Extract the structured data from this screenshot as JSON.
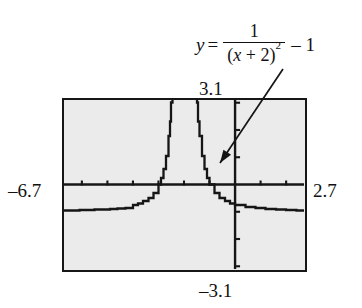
{
  "figure": {
    "kind": "graphing-calculator-screenshot",
    "equation": {
      "lhs": "y",
      "equals": "=",
      "numerator": "1",
      "denominator_open": "(",
      "denominator_var": "x",
      "denominator_plus": " + 2",
      "denominator_close": ")",
      "denominator_exponent": "2",
      "tail": "– 1",
      "plain": "y = 1/(x + 2)^2 – 1"
    },
    "window": {
      "ymax_label": "3.1",
      "ymin_label": "–3.1",
      "xmin_label": "–6.7",
      "xmax_label": "2.7"
    },
    "colors": {
      "screen_background": "#ebebeb",
      "frame": "#161616",
      "ink": "#111111",
      "curve": "#161616"
    }
  },
  "chart_data": {
    "type": "line",
    "title": "",
    "subtitle": "",
    "xlabel": "",
    "ylabel": "",
    "function": "y = 1/(x + 2)^2 - 1",
    "xlim": [
      -6.7,
      2.7
    ],
    "ylim": [
      -3.1,
      3.1
    ],
    "grid": false,
    "legend": null,
    "axes": {
      "x_axis_at_y": 0,
      "y_axis_at_x": 0,
      "x_tick_step": 1,
      "y_tick_step": 1,
      "x_ticks": [
        -6,
        -5,
        -4,
        -3,
        -2,
        -1,
        0,
        1,
        2
      ],
      "y_ticks": [
        -3,
        -2,
        -1,
        1,
        2,
        3
      ]
    },
    "asymptotes": {
      "vertical": [
        -2
      ],
      "horizontal": [
        -1
      ]
    },
    "annotations": [
      {
        "text": "y = 1/(x + 2)^2 - 1",
        "arrow_from": [
          0.35,
          3.55
        ],
        "arrow_to": [
          -1.25,
          0.62
        ]
      }
    ],
    "series": [
      {
        "name": "left branch",
        "x": [
          -6.7,
          -6.4,
          -6.1,
          -5.8,
          -5.5,
          -5.2,
          -4.9,
          -4.6,
          -4.3,
          -4.0,
          -3.8,
          -3.6,
          -3.4,
          -3.2,
          -3.0,
          -2.9,
          -2.8,
          -2.7,
          -2.6,
          -2.55,
          -2.5,
          -2.45,
          -2.4,
          -2.35,
          -2.3,
          -2.26,
          -2.22,
          -2.19,
          -2.16,
          -2.14,
          -2.12,
          -2.1
        ],
        "y": [
          -0.952,
          -0.948,
          -0.942,
          -0.935,
          -0.926,
          -0.915,
          -0.901,
          -0.882,
          -0.858,
          -0.75,
          -0.691,
          -0.609,
          -0.49,
          -0.306,
          0.0,
          0.235,
          0.563,
          1.041,
          1.778,
          2.306,
          3.0,
          3.938,
          5.25,
          7.163,
          10.111,
          14.16,
          24.51,
          26.717,
          38.062,
          50.02,
          68.361,
          99.0
        ],
        "clipped_to_ylim": true
      },
      {
        "name": "right branch",
        "x": [
          -1.9,
          -1.88,
          -1.86,
          -1.84,
          -1.81,
          -1.78,
          -1.75,
          -1.7,
          -1.65,
          -1.6,
          -1.55,
          -1.5,
          -1.45,
          -1.4,
          -1.3,
          -1.2,
          -1.1,
          -1.0,
          -0.8,
          -0.6,
          -0.4,
          -0.2,
          0.0,
          0.4,
          0.8,
          1.2,
          1.6,
          2.0,
          2.4,
          2.7
        ],
        "y": [
          99.0,
          68.361,
          50.02,
          38.062,
          26.717,
          19.676,
          15.0,
          10.111,
          7.163,
          5.25,
          3.938,
          3.0,
          2.306,
          1.778,
          1.041,
          0.563,
          0.235,
          0.0,
          -0.306,
          -0.49,
          -0.609,
          -0.691,
          -0.75,
          -0.826,
          -0.867,
          -0.893,
          -0.911,
          -0.938,
          -0.947,
          -0.952
        ],
        "clipped_to_ylim": true
      }
    ]
  }
}
